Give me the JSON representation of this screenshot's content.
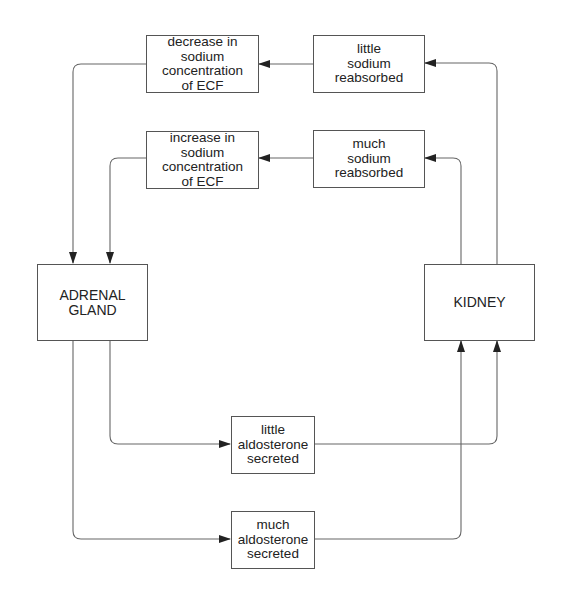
{
  "diagram": {
    "type": "feedback-loop",
    "nodes": {
      "adrenal_gland": {
        "lines": [
          "ADRENAL",
          "GLAND"
        ]
      },
      "kidney": {
        "lines": [
          "KIDNEY"
        ]
      },
      "decrease_sodium": {
        "lines": [
          "decrease in",
          "sodium",
          "concentration",
          "of ECF"
        ]
      },
      "increase_sodium": {
        "lines": [
          "increase in",
          "sodium",
          "concentration",
          "of ECF"
        ]
      },
      "little_sodium": {
        "lines": [
          "little",
          "sodium",
          "reabsorbed"
        ]
      },
      "much_sodium": {
        "lines": [
          "much",
          "sodium",
          "reabsorbed"
        ]
      },
      "little_aldosterone": {
        "lines": [
          "little",
          "aldosterone",
          "secreted"
        ]
      },
      "much_aldosterone": {
        "lines": [
          "much",
          "aldosterone",
          "secreted"
        ]
      }
    },
    "edges": [
      {
        "from": "adrenal_gland",
        "to": "much_aldosterone"
      },
      {
        "from": "adrenal_gland",
        "to": "little_aldosterone"
      },
      {
        "from": "much_aldosterone",
        "to": "kidney"
      },
      {
        "from": "little_aldosterone",
        "to": "kidney"
      },
      {
        "from": "kidney",
        "to": "much_sodium"
      },
      {
        "from": "kidney",
        "to": "little_sodium"
      },
      {
        "from": "much_sodium",
        "to": "increase_sodium"
      },
      {
        "from": "little_sodium",
        "to": "decrease_sodium"
      },
      {
        "from": "increase_sodium",
        "to": "adrenal_gland"
      },
      {
        "from": "decrease_sodium",
        "to": "adrenal_gland"
      }
    ],
    "colors": {
      "line": "#555555",
      "text": "#222222",
      "background": "#ffffff"
    }
  }
}
